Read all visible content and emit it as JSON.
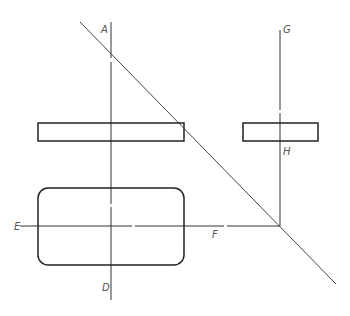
{
  "diagram": {
    "type": "orthographic-projection-drawing",
    "colors": {
      "line": "#333333",
      "thin_line": "#555555",
      "label": "#555555",
      "background": "#ffffff"
    },
    "labels": {
      "A": "A",
      "D": "D",
      "E": "E",
      "F": "F",
      "G": "G",
      "H": "H"
    },
    "elements": {
      "axis_AD": {
        "x": 111,
        "y1": 22,
        "y2": 300
      },
      "axis_EF": {
        "y": 226,
        "x1": 20,
        "x2": 280
      },
      "axis_GH": {
        "x": 280,
        "y1": 30,
        "y2": 226
      },
      "diagonal": {
        "x1": 80,
        "y1": 22,
        "x2": 336,
        "y2": 284
      },
      "top_view_rect_left": {
        "x": 38,
        "y": 123,
        "w": 146,
        "h": 18
      },
      "side_view_rect_right": {
        "x": 243,
        "y": 123,
        "w": 75,
        "h": 18
      },
      "front_view_rounded_rect": {
        "x": 38,
        "y": 188,
        "w": 146,
        "h": 77,
        "rx": 10
      }
    }
  }
}
